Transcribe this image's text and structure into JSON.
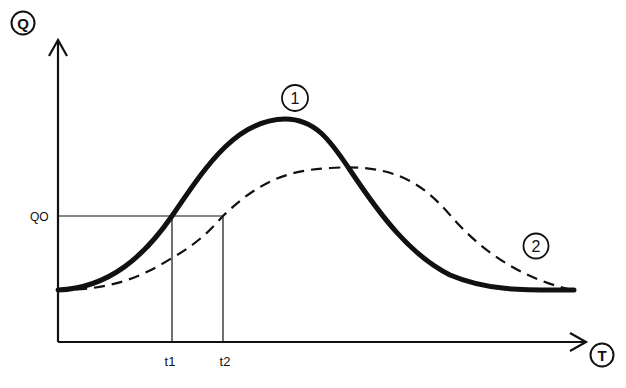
{
  "diagram": {
    "axes": {
      "y_label": "Q",
      "x_label": "T"
    },
    "threshold": {
      "label": "QO"
    },
    "time_marks": [
      {
        "label": "t1"
      },
      {
        "label": "t2"
      }
    ],
    "curves": [
      {
        "id": "1",
        "label": "1",
        "style": "solid-thick",
        "description": "narrow, tall peak"
      },
      {
        "id": "2",
        "label": "2",
        "style": "dashed",
        "description": "broad, lower, later peak"
      }
    ],
    "colors": {
      "ink": "#111111",
      "background": "#ffffff"
    }
  }
}
